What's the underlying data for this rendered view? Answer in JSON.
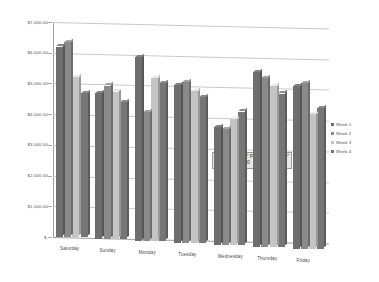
{
  "chart_data": {
    "type": "bar",
    "title": "",
    "xlabel": "",
    "ylabel": "",
    "ylim": [
      0,
      7000
    ],
    "ytick_values": [
      0,
      1000,
      2000,
      3000,
      4000,
      5000,
      6000,
      7000
    ],
    "ytick_labels": [
      "$-",
      "$1,000.00",
      "$2,000.00",
      "$3,000.00",
      "$4,000.00",
      "$5,000.00",
      "$6,000.00",
      "$7,000.00"
    ],
    "grid": true,
    "legend_position": "right",
    "categories": [
      "Saturday",
      "Sunday",
      "Monday",
      "Tuesday",
      "Wednesday",
      "Thursday",
      "Friday"
    ],
    "series": [
      {
        "name": "Week 1",
        "color": "#6e6e6e",
        "values": [
          6200,
          4750,
          6000,
          5150,
          3850,
          5700,
          5300
        ]
      },
      {
        "name": "Week 2",
        "color": "#8a8a8a",
        "values": [
          6350,
          5000,
          4200,
          5250,
          3770,
          5500,
          5400
        ]
      },
      {
        "name": "Week 3",
        "color": "#c4c4c4",
        "values": [
          5200,
          4800,
          5300,
          4950,
          4100,
          5250,
          4400
        ]
      },
      {
        "name": "Week 4",
        "color": "#767676",
        "values": [
          4700,
          4450,
          5150,
          4750,
          4350,
          5000,
          4600
        ]
      }
    ]
  },
  "legend": {
    "items": [
      {
        "label": "Week 1",
        "color": "#6e6e6e"
      },
      {
        "label": "Week 2",
        "color": "#8a8a8a"
      },
      {
        "label": "Week 3",
        "color": "#c4c4c4"
      },
      {
        "label": "Week 4",
        "color": "#767676"
      }
    ]
  },
  "tooltip": {
    "line1": "Series \"Week 2\" Point \"Wednesday\"",
    "line2": "Value: $3,770.00"
  }
}
